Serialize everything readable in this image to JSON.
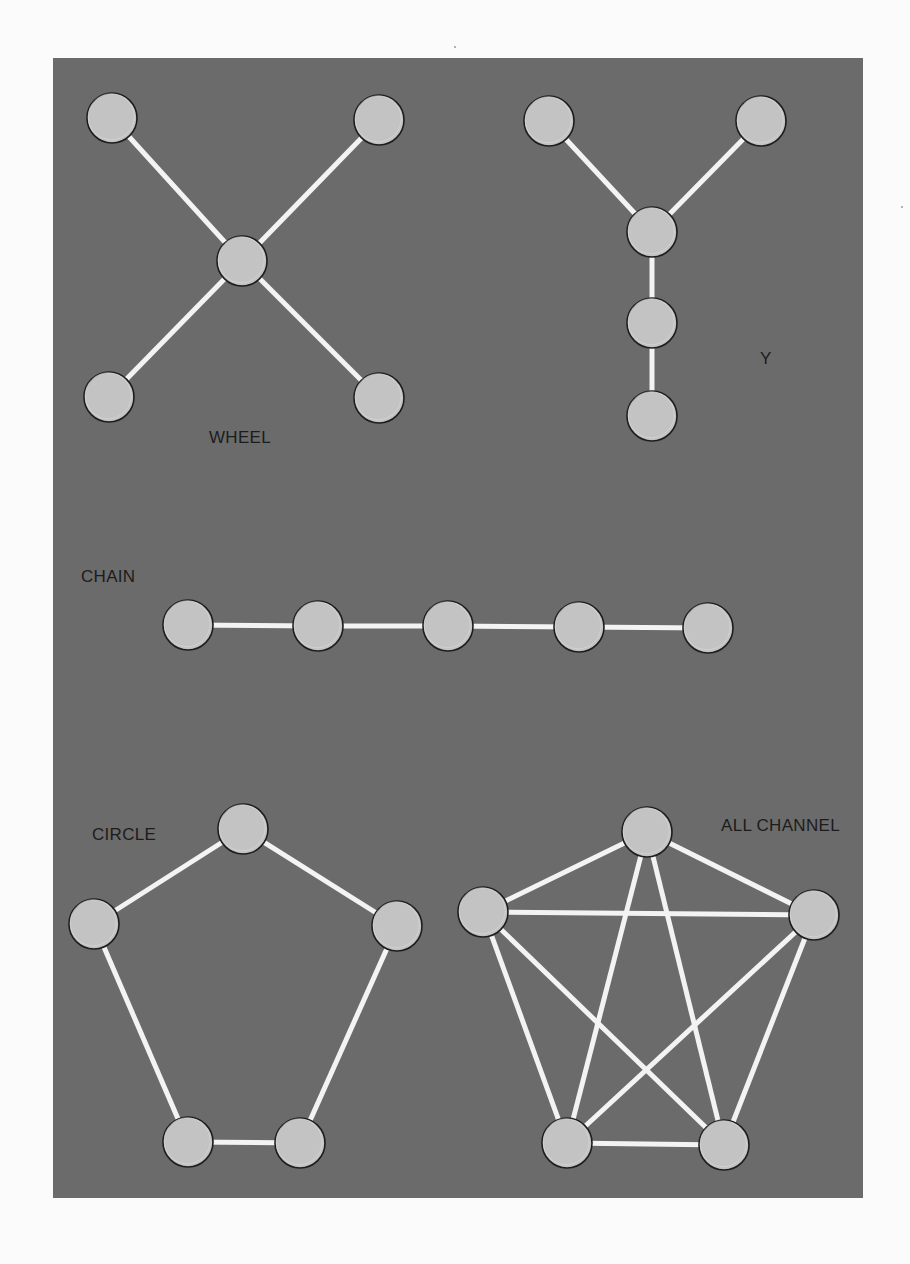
{
  "figure": {
    "background": "#fbfbfb",
    "panel": {
      "x": 53,
      "y": 58,
      "width": 810,
      "height": 1140,
      "color": "#6b6b6b"
    },
    "node_fill": "#c3c3c3",
    "node_stroke": "#1d1d1d",
    "edge_color": "#f3f3f3",
    "label_color": "#1c1c1c",
    "node_radius": 25
  },
  "networks": [
    {
      "id": "wheel",
      "label": "WHEEL",
      "label_pos": [
        209,
        443
      ],
      "nodes": [
        [
          112,
          118
        ],
        [
          379,
          120
        ],
        [
          242,
          261
        ],
        [
          109,
          397
        ],
        [
          379,
          398
        ]
      ],
      "edges": [
        [
          0,
          2
        ],
        [
          1,
          2
        ],
        [
          2,
          3
        ],
        [
          2,
          4
        ]
      ]
    },
    {
      "id": "y",
      "label": "Y",
      "label_pos": [
        760,
        364
      ],
      "nodes": [
        [
          549,
          121
        ],
        [
          761,
          121
        ],
        [
          652,
          232
        ],
        [
          652,
          323
        ],
        [
          652,
          416
        ]
      ],
      "edges": [
        [
          0,
          2
        ],
        [
          1,
          2
        ],
        [
          2,
          3
        ],
        [
          3,
          4
        ]
      ]
    },
    {
      "id": "chain",
      "label": "CHAIN",
      "label_pos": [
        81,
        582
      ],
      "nodes": [
        [
          188,
          625
        ],
        [
          318,
          626
        ],
        [
          448,
          626
        ],
        [
          579,
          627
        ],
        [
          708,
          628
        ]
      ],
      "edges": [
        [
          0,
          1
        ],
        [
          1,
          2
        ],
        [
          2,
          3
        ],
        [
          3,
          4
        ]
      ]
    },
    {
      "id": "circle",
      "label": "CIRCLE",
      "label_pos": [
        92,
        840
      ],
      "nodes": [
        [
          243,
          829
        ],
        [
          94,
          924
        ],
        [
          397,
          926
        ],
        [
          188,
          1142
        ],
        [
          300,
          1143
        ]
      ],
      "edges": [
        [
          0,
          1
        ],
        [
          0,
          2
        ],
        [
          1,
          3
        ],
        [
          2,
          4
        ],
        [
          3,
          4
        ]
      ]
    },
    {
      "id": "all-channel",
      "label": "ALL CHANNEL",
      "label_pos": [
        721,
        831
      ],
      "nodes": [
        [
          647,
          832
        ],
        [
          483,
          912
        ],
        [
          814,
          915
        ],
        [
          567,
          1143
        ],
        [
          724,
          1145
        ]
      ],
      "edges": [
        [
          0,
          1
        ],
        [
          0,
          2
        ],
        [
          0,
          3
        ],
        [
          0,
          4
        ],
        [
          1,
          2
        ],
        [
          1,
          3
        ],
        [
          1,
          4
        ],
        [
          2,
          3
        ],
        [
          2,
          4
        ],
        [
          3,
          4
        ]
      ]
    }
  ],
  "labels": {
    "wheel": "WHEEL",
    "y": "Y",
    "chain": "CHAIN",
    "circle": "CIRCLE",
    "all_channel": "ALL CHANNEL"
  }
}
